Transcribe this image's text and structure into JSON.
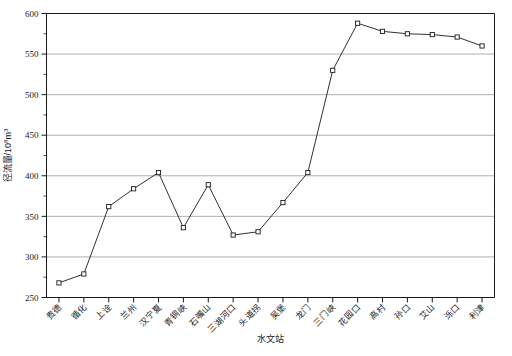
{
  "chart_data": {
    "type": "line",
    "title": "",
    "xlabel": "水文站",
    "ylabel": "径流量/10⁸m³",
    "ylabel_base": "径流量/10",
    "ylabel_sup": "8",
    "ylabel_unit": "m",
    "ylabel_unit_sup": "3",
    "ylim": [
      250,
      600
    ],
    "ytick_step": 50,
    "yminor_step": 25,
    "grid": "horizontal",
    "legend": "none",
    "marker": "open-square",
    "line_color": "#1a1a1a",
    "grid_color": "#9a9a9a",
    "axis_color": "#1a1a1a",
    "categories": [
      "贵德",
      "循化",
      "上诠",
      "兰州",
      "汉宁夏",
      "青铜峡",
      "石嘴山",
      "三湖河口",
      "头道拐",
      "吴堡",
      "龙门",
      "三门峡",
      "花园口",
      "高村",
      "孙口",
      "艾山",
      "泺口",
      "利津"
    ],
    "yticks": [
      250,
      300,
      350,
      400,
      450,
      500,
      550,
      600
    ],
    "ytick_labels": [
      "250",
      "300",
      "350",
      "400",
      "450",
      "500",
      "550",
      "600"
    ],
    "values": [
      268,
      279,
      362,
      384,
      404,
      336,
      389,
      327,
      331,
      367,
      404,
      530,
      588,
      578,
      575,
      574,
      571,
      560
    ],
    "series": [
      {
        "name": "径流量",
        "values": [
          268,
          279,
          362,
          384,
          404,
          336,
          389,
          327,
          331,
          367,
          404,
          530,
          588,
          578,
          575,
          574,
          571,
          560
        ]
      }
    ]
  }
}
